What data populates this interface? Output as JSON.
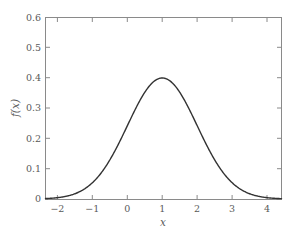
{
  "chart_data": {
    "type": "line",
    "title": "",
    "subtitle": "",
    "xlabel": "x",
    "ylabel": "f(x)",
    "xlim": [
      -2.34,
      4.41
    ],
    "ylim": [
      0,
      0.6
    ],
    "grid": false,
    "legend": null,
    "legend_position": "none",
    "xticks": [
      -2,
      -1,
      0,
      1,
      2,
      3,
      4
    ],
    "xtick_labels": [
      "−2",
      "−1",
      "0",
      "1",
      "2",
      "3",
      "4"
    ],
    "yticks": [
      0,
      0.1,
      0.2,
      0.3,
      0.4,
      0.5,
      0.6
    ],
    "ytick_labels": [
      "0",
      "0.1",
      "0.2",
      "0.3",
      "0.4",
      "0.5",
      "0.6"
    ],
    "series": [
      {
        "name": "f(x)",
        "color": "#333333",
        "linewidth": 1.4,
        "description": "Gaussian probability density, mean 1, standard deviation 1, peak value 0.4 at x = 1",
        "x": [
          -2.34,
          -2.2,
          -2.0,
          -1.8,
          -1.6,
          -1.4,
          -1.2,
          -1.0,
          -0.8,
          -0.6,
          -0.4,
          -0.2,
          0.0,
          0.2,
          0.4,
          0.6,
          0.8,
          1.0,
          1.2,
          1.4,
          1.6,
          1.8,
          2.0,
          2.2,
          2.4,
          2.6,
          2.8,
          3.0,
          3.2,
          3.4,
          3.6,
          3.8,
          4.0,
          4.2,
          4.41
        ],
        "y": [
          0.002,
          0.003,
          0.004,
          0.006,
          0.009,
          0.014,
          0.019,
          0.027,
          0.036,
          0.048,
          0.063,
          0.079,
          0.097,
          0.116,
          0.136,
          0.156,
          0.176,
          0.194,
          0.21,
          0.222,
          0.231,
          0.235,
          0.235,
          0.231,
          0.222,
          0.21,
          0.194,
          0.176,
          0.156,
          0.136,
          0.116,
          0.097,
          0.079,
          0.063,
          0.046
        ],
        "peak": {
          "x": 1,
          "y": 0.4
        }
      }
    ],
    "axis_color": "#8a8a8a",
    "text_color": "#5a5a5a",
    "background_color": "#ffffff"
  },
  "figure": {
    "axis_color": "#8a8a8a",
    "curve_color": "#333333"
  }
}
